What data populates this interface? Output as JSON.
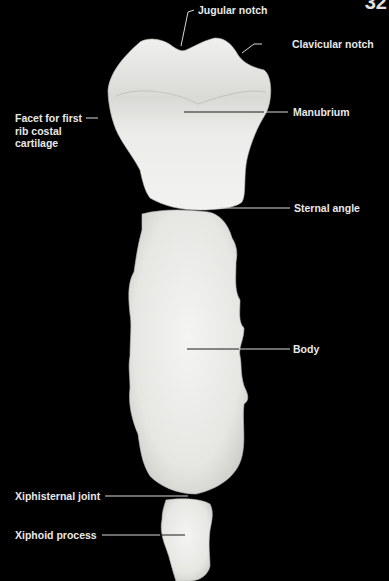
{
  "page": {
    "number": "32",
    "background": "#000000",
    "bone_color": "#e9e9e6",
    "label_color": "#e8e8e8"
  },
  "figure": {
    "parts": [
      "manubrium",
      "body",
      "xiphoid-process"
    ]
  },
  "labels": {
    "jugular_notch": "Jugular notch",
    "clavicular_notch": "Clavicular notch",
    "facet_line1": "Facet for first",
    "facet_line2": "rib costal",
    "facet_line3": "cartilage",
    "manubrium": "Manubrium",
    "sternal_angle": "Sternal angle",
    "body": "Body",
    "xiphisternal_joint": "Xiphisternal joint",
    "xiphoid_process": "Xiphoid process"
  }
}
